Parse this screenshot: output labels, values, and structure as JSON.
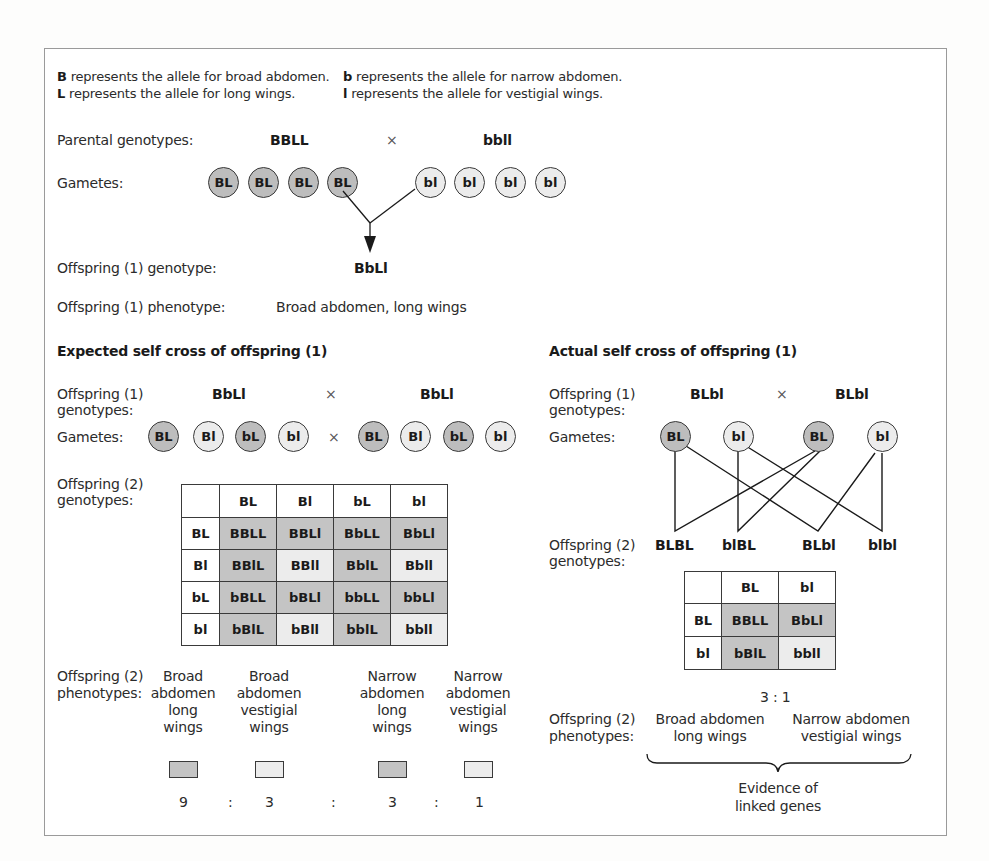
{
  "key": {
    "row1_left_symbol": "B",
    "row1_left_text": " represents the allele for broad abdomen.",
    "row1_right_symbol": "b",
    "row1_right_text": " represents the allele for narrow abdomen.",
    "row2_left_symbol": "L",
    "row2_left_text": " represents the allele for long wings.",
    "row2_right_symbol": "l",
    "row2_right_text": " represents the allele for vestigial wings."
  },
  "parental": {
    "label": "Parental genotypes:",
    "genotype_1": "BBLL",
    "cross_symbol": "×",
    "genotype_2": "bbll",
    "gametes_label": "Gametes:",
    "gametes": [
      "BL",
      "BL",
      "BL",
      "BL",
      "bl",
      "bl",
      "bl",
      "bl"
    ],
    "offspring_genotype_label": "Offspring (1) genotype:",
    "offspring_genotype": "BbLl",
    "offspring_phenotype_label": "Offspring (1) phenotype:",
    "offspring_phenotype": "Broad abdomen, long wings"
  },
  "expected": {
    "heading": "Expected self cross of offspring (1)",
    "genotypes_label_1": "Offspring (1)",
    "genotypes_label_2": "genotypes:",
    "genotype_1": "BbLl",
    "cross_symbol": "×",
    "genotype_2": "BbLl",
    "gametes_label": "Gametes:",
    "gametes_left": [
      "BL",
      "Bl",
      "bL",
      "bl"
    ],
    "gametes_right": [
      "BL",
      "Bl",
      "bL",
      "bl"
    ],
    "offspring2_label_1": "Offspring (2)",
    "offspring2_label_2": "genotypes:",
    "table": {
      "col_headers": [
        "BL",
        "Bl",
        "bL",
        "bl"
      ],
      "rows": [
        {
          "header": "BL",
          "cells": [
            "BBLL",
            "BBLl",
            "BbLL",
            "BbLl"
          ]
        },
        {
          "header": "Bl",
          "cells": [
            "BBlL",
            "BBll",
            "BblL",
            "Bbll"
          ]
        },
        {
          "header": "bL",
          "cells": [
            "bBLL",
            "bBLl",
            "bbLL",
            "bbLl"
          ]
        },
        {
          "header": "bl",
          "cells": [
            "bBlL",
            "bBll",
            "bblL",
            "bbll"
          ]
        }
      ]
    },
    "phenotypes_label_1": "Offspring (2)",
    "phenotypes_label_2": "phenotypes:",
    "phenotypes": [
      {
        "lines": [
          "Broad",
          "abdomen",
          "long",
          "wings"
        ],
        "ratio": "9"
      },
      {
        "lines": [
          "Broad",
          "abdomen",
          "vestigial",
          "wings"
        ],
        "ratio": "3"
      },
      {
        "lines": [
          "Narrow",
          "abdomen",
          "long",
          "wings"
        ],
        "ratio": "3"
      },
      {
        "lines": [
          "Narrow",
          "abdomen",
          "vestigial",
          "wings"
        ],
        "ratio": "1"
      }
    ],
    "ratio_separator": ":"
  },
  "actual": {
    "heading": "Actual self cross of offspring (1)",
    "genotypes_label_1": "Offspring (1)",
    "genotypes_label_2": "genotypes:",
    "genotype_1": "BLbl",
    "cross_symbol": "×",
    "genotype_2": "BLbl",
    "gametes_label": "Gametes:",
    "gametes": [
      "BL",
      "bl",
      "BL",
      "bl"
    ],
    "offspring2_label_1": "Offspring (2)",
    "offspring2_label_2": "genotypes:",
    "offspring2_genotypes": [
      "BLBL",
      "blBL",
      "BLbl",
      "blbl"
    ],
    "table": {
      "col_headers": [
        "BL",
        "bl"
      ],
      "rows": [
        {
          "header": "BL",
          "cells": [
            "BBLL",
            "BbLl"
          ]
        },
        {
          "header": "bl",
          "cells": [
            "bBlL",
            "bbll"
          ]
        }
      ]
    },
    "ratio": "3 : 1",
    "phenotypes_label_1": "Offspring (2)",
    "phenotypes_label_2": "phenotypes:",
    "phenotype_1_lines": [
      "Broad abdomen",
      "long wings"
    ],
    "phenotype_2_lines": [
      "Narrow abdomen",
      "vestigial wings"
    ],
    "evidence_lines": [
      "Evidence of",
      "linked genes"
    ]
  },
  "colors": {
    "dominant_fill": "#c4c4c4",
    "recessive_fill": "#ececec",
    "line": "#1a1a1a",
    "frame_border": "#9a9a9a"
  }
}
